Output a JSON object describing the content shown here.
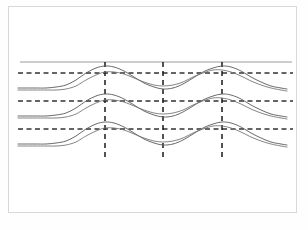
{
  "figure": {
    "title": "",
    "caption": "",
    "background_color": "#ffffff",
    "frame": {
      "name": "figure-border",
      "x": 8,
      "y": 6,
      "width": 289,
      "height": 207,
      "color": "#d8d8d8",
      "stroke_width": 1
    }
  },
  "colors": {
    "curve_dark": "#595959",
    "curve_mid": "#777777",
    "reference_solid": "#9a9a9a",
    "dashed_horizontal": "#333333",
    "dashed_vertical": "#1a1a1a",
    "frame": "#d8d8d8"
  },
  "chart_data": {
    "type": "line",
    "title": "",
    "subtitle": "",
    "xlabel": "",
    "ylabel": "",
    "grid": false,
    "legend": "none",
    "xlim": [
      18,
      293
    ],
    "ylim": [
      56,
      170
    ],
    "x_markers": {
      "label": "vertical-dashed-marker-lines",
      "values": [
        105,
        163,
        222
      ],
      "y_top": 62,
      "y_bottom": 160,
      "style": "dashed",
      "color": "#1a1a1a"
    },
    "reference_levels": {
      "label": "horizontal-dashed-reference-lines",
      "values": [
        73,
        101,
        129
      ],
      "x_start": 18,
      "x_end": 293,
      "style": "dashed",
      "color": "#333333"
    },
    "top_reference_line": {
      "label": "solid-upper-reference-line",
      "y": 62,
      "x_start": 20,
      "x_end": 292,
      "style": "solid",
      "color": "#9a9a9a"
    },
    "series": [
      {
        "name": "band-1-curve-a",
        "band": 1,
        "color": "#595959",
        "baseline_y": 88,
        "points": [
          [
            18,
            88
          ],
          [
            34,
            88
          ],
          [
            46,
            88
          ],
          [
            56,
            87
          ],
          [
            66,
            85
          ],
          [
            76,
            80
          ],
          [
            86,
            73
          ],
          [
            96,
            68
          ],
          [
            105,
            66
          ],
          [
            114,
            67
          ],
          [
            124,
            71
          ],
          [
            134,
            77
          ],
          [
            144,
            83
          ],
          [
            154,
            87
          ],
          [
            163,
            89
          ],
          [
            173,
            88
          ],
          [
            183,
            84
          ],
          [
            193,
            78
          ],
          [
            203,
            72
          ],
          [
            213,
            68
          ],
          [
            222,
            66
          ],
          [
            231,
            67
          ],
          [
            241,
            71
          ],
          [
            251,
            77
          ],
          [
            261,
            82
          ],
          [
            271,
            86
          ],
          [
            281,
            88
          ],
          [
            287,
            89
          ]
        ]
      },
      {
        "name": "band-1-curve-b",
        "band": 1,
        "color": "#777777",
        "baseline_y": 90,
        "points": [
          [
            18,
            90
          ],
          [
            34,
            90
          ],
          [
            46,
            90
          ],
          [
            56,
            90
          ],
          [
            66,
            89
          ],
          [
            76,
            86
          ],
          [
            86,
            80
          ],
          [
            96,
            75
          ],
          [
            105,
            72
          ],
          [
            114,
            72
          ],
          [
            124,
            74
          ],
          [
            134,
            78
          ],
          [
            144,
            82
          ],
          [
            154,
            85
          ],
          [
            163,
            86
          ],
          [
            173,
            85
          ],
          [
            183,
            82
          ],
          [
            193,
            77
          ],
          [
            203,
            73
          ],
          [
            213,
            70
          ],
          [
            222,
            70
          ],
          [
            231,
            72
          ],
          [
            241,
            76
          ],
          [
            251,
            81
          ],
          [
            261,
            85
          ],
          [
            271,
            88
          ],
          [
            281,
            90
          ],
          [
            287,
            91
          ]
        ]
      },
      {
        "name": "band-2-curve-a",
        "band": 2,
        "color": "#595959",
        "baseline_y": 116,
        "points": [
          [
            18,
            116
          ],
          [
            34,
            116
          ],
          [
            46,
            116
          ],
          [
            56,
            115
          ],
          [
            66,
            113
          ],
          [
            76,
            108
          ],
          [
            86,
            101
          ],
          [
            96,
            96
          ],
          [
            105,
            94
          ],
          [
            114,
            95
          ],
          [
            124,
            99
          ],
          [
            134,
            105
          ],
          [
            144,
            111
          ],
          [
            154,
            115
          ],
          [
            163,
            117
          ],
          [
            173,
            116
          ],
          [
            183,
            112
          ],
          [
            193,
            106
          ],
          [
            203,
            100
          ],
          [
            213,
            96
          ],
          [
            222,
            94
          ],
          [
            231,
            95
          ],
          [
            241,
            99
          ],
          [
            251,
            105
          ],
          [
            261,
            110
          ],
          [
            271,
            114
          ],
          [
            281,
            116
          ],
          [
            287,
            117
          ]
        ]
      },
      {
        "name": "band-2-curve-b",
        "band": 2,
        "color": "#777777",
        "baseline_y": 118,
        "points": [
          [
            18,
            118
          ],
          [
            34,
            118
          ],
          [
            46,
            118
          ],
          [
            56,
            118
          ],
          [
            66,
            117
          ],
          [
            76,
            114
          ],
          [
            86,
            108
          ],
          [
            96,
            103
          ],
          [
            105,
            100
          ],
          [
            114,
            100
          ],
          [
            124,
            102
          ],
          [
            134,
            106
          ],
          [
            144,
            110
          ],
          [
            154,
            113
          ],
          [
            163,
            114
          ],
          [
            173,
            113
          ],
          [
            183,
            110
          ],
          [
            193,
            105
          ],
          [
            203,
            101
          ],
          [
            213,
            98
          ],
          [
            222,
            98
          ],
          [
            231,
            100
          ],
          [
            241,
            104
          ],
          [
            251,
            109
          ],
          [
            261,
            113
          ],
          [
            271,
            116
          ],
          [
            281,
            118
          ],
          [
            287,
            119
          ]
        ]
      },
      {
        "name": "band-3-curve-a",
        "band": 3,
        "color": "#595959",
        "baseline_y": 144,
        "points": [
          [
            18,
            144
          ],
          [
            34,
            144
          ],
          [
            46,
            144
          ],
          [
            56,
            143
          ],
          [
            66,
            141
          ],
          [
            76,
            136
          ],
          [
            86,
            129
          ],
          [
            96,
            124
          ],
          [
            105,
            122
          ],
          [
            114,
            123
          ],
          [
            124,
            127
          ],
          [
            134,
            133
          ],
          [
            144,
            139
          ],
          [
            154,
            143
          ],
          [
            163,
            145
          ],
          [
            173,
            144
          ],
          [
            183,
            140
          ],
          [
            193,
            134
          ],
          [
            203,
            128
          ],
          [
            213,
            124
          ],
          [
            222,
            122
          ],
          [
            231,
            123
          ],
          [
            241,
            127
          ],
          [
            251,
            133
          ],
          [
            261,
            138
          ],
          [
            271,
            142
          ],
          [
            281,
            144
          ],
          [
            287,
            145
          ]
        ]
      },
      {
        "name": "band-3-curve-b",
        "band": 3,
        "color": "#777777",
        "baseline_y": 146,
        "points": [
          [
            18,
            146
          ],
          [
            34,
            146
          ],
          [
            46,
            146
          ],
          [
            56,
            146
          ],
          [
            66,
            145
          ],
          [
            76,
            142
          ],
          [
            86,
            136
          ],
          [
            96,
            131
          ],
          [
            105,
            128
          ],
          [
            114,
            128
          ],
          [
            124,
            130
          ],
          [
            134,
            134
          ],
          [
            144,
            138
          ],
          [
            154,
            141
          ],
          [
            163,
            142
          ],
          [
            173,
            141
          ],
          [
            183,
            138
          ],
          [
            193,
            133
          ],
          [
            203,
            129
          ],
          [
            213,
            126
          ],
          [
            222,
            126
          ],
          [
            231,
            128
          ],
          [
            241,
            132
          ],
          [
            251,
            137
          ],
          [
            261,
            141
          ],
          [
            271,
            144
          ],
          [
            281,
            146
          ],
          [
            287,
            147
          ]
        ]
      }
    ]
  }
}
